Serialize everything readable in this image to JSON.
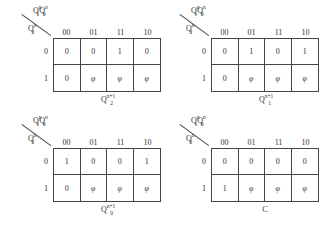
{
  "column_values": [
    "00",
    "01",
    "11",
    "10"
  ],
  "row_values": [
    "0",
    "1"
  ],
  "maps": [
    {
      "col_var": "Q1nQ0n",
      "row_var": "Q2n",
      "caption": "Q2n+1",
      "cells": [
        [
          "0",
          "0",
          "1",
          "0"
        ],
        [
          "0",
          "φ",
          "φ",
          "φ"
        ]
      ]
    },
    {
      "col_var": "Q1nQ0n",
      "row_var": "Q2n",
      "caption": "Q1n+1",
      "cells": [
        [
          "0",
          "1",
          "0",
          "1"
        ],
        [
          "0",
          "φ",
          "φ",
          "φ"
        ]
      ]
    },
    {
      "col_var": "Q1nQ0n",
      "row_var": "Q2n",
      "caption": "Q0n+1",
      "cells": [
        [
          "1",
          "0",
          "0",
          "1"
        ],
        [
          "0",
          "φ",
          "φ",
          "φ"
        ]
      ]
    },
    {
      "col_var": "Q1nQ0n",
      "row_var": "Q2n",
      "caption": "C",
      "cells": [
        [
          "0",
          "0",
          "0",
          "0"
        ],
        [
          "1",
          "φ",
          "φ",
          "φ"
        ]
      ]
    }
  ]
}
